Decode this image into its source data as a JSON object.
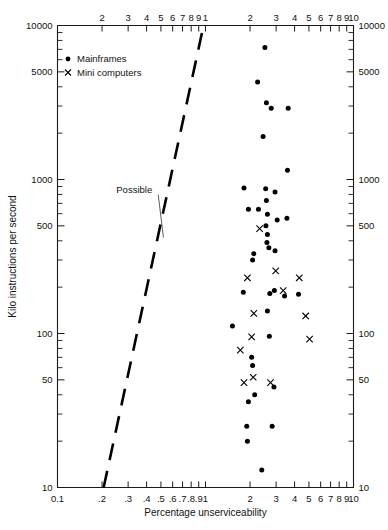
{
  "chart_data": {
    "type": "scatter",
    "title": "",
    "xlabel": "Percentage unserviceability",
    "ylabel": "Kilo instructions per second",
    "xscale": "log",
    "yscale": "log",
    "xlim": [
      0.1,
      10
    ],
    "ylim": [
      10,
      10000
    ],
    "grid": false,
    "legend_position": "top-left-inside",
    "x_tick_labels_bottom": [
      "0.1",
      ".2",
      ".3",
      ".4",
      ".5",
      ".6",
      ".7",
      ".8",
      ".9",
      "1",
      "2",
      "3",
      "4",
      "5",
      "6",
      "7",
      "8",
      "9",
      "10"
    ],
    "x_tick_values_bottom": [
      0.1,
      0.2,
      0.3,
      0.4,
      0.5,
      0.6,
      0.7,
      0.8,
      0.9,
      1,
      2,
      3,
      4,
      5,
      6,
      7,
      8,
      9,
      10
    ],
    "x_tick_labels_top": [
      "2",
      "3",
      "4",
      "5",
      "6",
      "7",
      "8",
      "9",
      "1",
      "2",
      "3",
      "4",
      "5",
      "6",
      "7",
      "8",
      "9",
      "10"
    ],
    "x_tick_values_top": [
      0.2,
      0.3,
      0.4,
      0.5,
      0.6,
      0.7,
      0.8,
      0.9,
      1,
      2,
      3,
      4,
      5,
      6,
      7,
      8,
      9,
      10
    ],
    "y_tick_labels": [
      "10000",
      "5000",
      "1000",
      "500",
      "100",
      "50",
      "10"
    ],
    "y_tick_values": [
      10000,
      5000,
      1000,
      500,
      100,
      50,
      10
    ],
    "y_minor_ticks": [
      20,
      30,
      40,
      60,
      70,
      80,
      90,
      200,
      300,
      400,
      600,
      700,
      800,
      900,
      2000,
      3000,
      4000,
      6000,
      7000,
      8000,
      9000
    ],
    "annotations": [
      {
        "text": "Possible",
        "x_value": 0.33,
        "y_value": 820,
        "points_to_x": 0.52,
        "points_to_y": 420
      }
    ],
    "reference_line": {
      "label": "Possible",
      "style": "dashed",
      "from": {
        "x": 0.205,
        "y": 10
      },
      "to": {
        "x": 0.97,
        "y": 10000
      }
    },
    "series": [
      {
        "name": "Mainframes",
        "marker": "dot",
        "points": [
          [
            2.52,
            7200
          ],
          [
            2.25,
            4300
          ],
          [
            2.58,
            3150
          ],
          [
            2.78,
            2900
          ],
          [
            3.62,
            2900
          ],
          [
            2.45,
            1900
          ],
          [
            3.58,
            1150
          ],
          [
            1.82,
            880
          ],
          [
            2.55,
            870
          ],
          [
            2.95,
            830
          ],
          [
            2.58,
            730
          ],
          [
            1.95,
            640
          ],
          [
            2.28,
            640
          ],
          [
            2.62,
            595
          ],
          [
            3.55,
            560
          ],
          [
            3.05,
            545
          ],
          [
            2.56,
            500
          ],
          [
            2.62,
            440
          ],
          [
            2.6,
            390
          ],
          [
            2.68,
            360
          ],
          [
            2.95,
            345
          ],
          [
            2.12,
            330
          ],
          [
            2.08,
            300
          ],
          [
            1.8,
            185
          ],
          [
            2.72,
            182
          ],
          [
            2.92,
            190
          ],
          [
            3.42,
            175
          ],
          [
            4.25,
            180
          ],
          [
            2.62,
            140
          ],
          [
            1.52,
            112
          ],
          [
            2.7,
            96
          ],
          [
            2.05,
            70
          ],
          [
            2.08,
            62
          ],
          [
            2.9,
            45
          ],
          [
            2.15,
            40
          ],
          [
            1.95,
            36
          ],
          [
            1.9,
            25
          ],
          [
            2.82,
            25
          ],
          [
            1.92,
            20
          ],
          [
            2.4,
            13
          ]
        ]
      },
      {
        "name": "Mini computers",
        "marker": "cross",
        "points": [
          [
            2.32,
            480
          ],
          [
            2.98,
            255
          ],
          [
            1.92,
            230
          ],
          [
            4.3,
            230
          ],
          [
            3.35,
            190
          ],
          [
            2.12,
            135
          ],
          [
            4.75,
            130
          ],
          [
            2.05,
            95
          ],
          [
            1.72,
            78
          ],
          [
            2.1,
            52
          ],
          [
            1.82,
            48
          ],
          [
            2.75,
            48
          ],
          [
            5.05,
            92
          ]
        ]
      }
    ]
  },
  "legend": {
    "items": [
      {
        "label": "Mainframes",
        "marker": "dot"
      },
      {
        "label": "Mini computers",
        "marker": "cross"
      }
    ]
  },
  "axes": {
    "left_title": "Kilo instructions per second",
    "bottom_title": "Percentage unserviceability"
  }
}
